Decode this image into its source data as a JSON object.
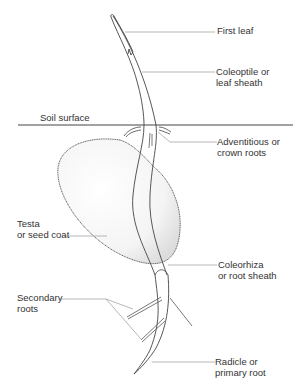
{
  "diagram": {
    "labels": {
      "first_leaf": "First leaf",
      "coleoptile": [
        "Coleoptile or",
        "leaf sheath"
      ],
      "soil_surface": "Soil surface",
      "adventitious": [
        "Adventitious or",
        "crown roots"
      ],
      "testa": [
        "Testa",
        "or seed coat"
      ],
      "coleorhiza": [
        "Coleorhiza",
        "or root sheath"
      ],
      "secondary": [
        "Secondary",
        "roots"
      ],
      "radicle": [
        "Radicle or",
        "primary root"
      ]
    },
    "colors": {
      "line": "#444444",
      "leader": "#999999",
      "stipple": "#bbbbbb"
    }
  }
}
